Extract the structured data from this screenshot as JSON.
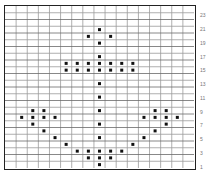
{
  "pattern": {
    "title": "Anchor cross-stitch chart",
    "columns": 17,
    "rows": 24,
    "row_labels": [
      "23",
      "21",
      "19",
      "17",
      "15",
      "13",
      "11",
      "9",
      "7",
      "5",
      "3",
      "1"
    ],
    "colors": {
      "stitch": "#111111",
      "grid": "#9a9a9a",
      "grid_major": "#6a6a6a",
      "border": "#222222",
      "label": "#777777"
    },
    "stitches": [
      [
        8,
        3
      ],
      [
        7,
        4
      ],
      [
        9,
        4
      ],
      [
        8,
        5
      ],
      [
        8,
        7
      ],
      [
        5,
        8
      ],
      [
        6,
        8
      ],
      [
        7,
        8
      ],
      [
        8,
        8
      ],
      [
        9,
        8
      ],
      [
        10,
        8
      ],
      [
        11,
        8
      ],
      [
        5,
        9
      ],
      [
        6,
        9
      ],
      [
        7,
        9
      ],
      [
        8,
        9
      ],
      [
        9,
        9
      ],
      [
        10,
        9
      ],
      [
        11,
        9
      ],
      [
        8,
        11
      ],
      [
        8,
        13
      ],
      [
        2,
        15
      ],
      [
        3,
        15
      ],
      [
        8,
        15
      ],
      [
        13,
        15
      ],
      [
        14,
        15
      ],
      [
        1,
        16
      ],
      [
        2,
        16
      ],
      [
        3,
        16
      ],
      [
        4,
        16
      ],
      [
        12,
        16
      ],
      [
        13,
        16
      ],
      [
        14,
        16
      ],
      [
        15,
        16
      ],
      [
        2,
        17
      ],
      [
        8,
        17
      ],
      [
        14,
        17
      ],
      [
        3,
        18
      ],
      [
        13,
        18
      ],
      [
        4,
        19
      ],
      [
        8,
        19
      ],
      [
        12,
        19
      ],
      [
        5,
        20
      ],
      [
        11,
        20
      ],
      [
        6,
        21
      ],
      [
        7,
        21
      ],
      [
        8,
        21
      ],
      [
        9,
        21
      ],
      [
        10,
        21
      ],
      [
        7,
        22
      ],
      [
        8,
        22
      ],
      [
        9,
        22
      ],
      [
        8,
        23
      ]
    ]
  }
}
